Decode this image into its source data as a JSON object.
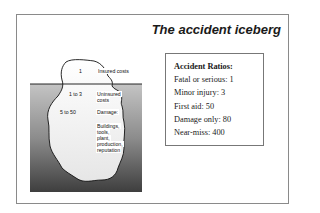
{
  "title": "The accident iceberg",
  "iceberg": {
    "levels": [
      {
        "ratio": "1",
        "label": "Insured costs"
      },
      {
        "ratio": "1 to 3",
        "label_lines": [
          "Uninsured",
          "costs"
        ]
      },
      {
        "ratio": "5 to 50",
        "label": "Damage:"
      }
    ],
    "damage_items": [
      "Buildings,",
      "tools,",
      "plant,",
      "production,",
      "reputation"
    ]
  },
  "ratios": {
    "heading": "Accident Ratios:",
    "items": [
      {
        "label": "Fatal or serious",
        "value": "1",
        "text": "Fatal or serious: 1"
      },
      {
        "label": "Minor injury",
        "value": "3",
        "text": "Minor injury: 3"
      },
      {
        "label": "First aid",
        "value": "50",
        "text": "First aid: 50"
      },
      {
        "label": "Damage only",
        "value": "80",
        "text": "Damage only: 80"
      },
      {
        "label": "Near-miss",
        "value": "400",
        "text": "Near-miss: 400"
      }
    ]
  },
  "colors": {
    "frame": "#8a8a8a",
    "water_top": "#b8b8b8",
    "water_bottom": "#4a4a4a",
    "ice": "#ffffff",
    "text": "#1a1a1a"
  }
}
